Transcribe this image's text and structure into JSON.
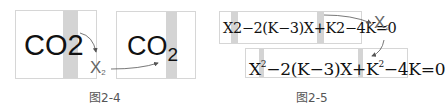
{
  "figure_2_4": {
    "before_text": "CO2",
    "after_main": "CO",
    "after_sub": "2",
    "tool_main": "X",
    "tool_sub": "2",
    "caption": "图2-4"
  },
  "figure_2_5": {
    "before_text": "X2−2(K−3)X+K2−4K=0",
    "after_parts": {
      "p1": "X",
      "sup1": "2",
      "p2": "−2(K−3)X+K",
      "sup2": "2",
      "p3": "−4K=0"
    },
    "tool_main": "X",
    "tool_sub": "2",
    "caption": "图2-5"
  },
  "colors": {
    "highlight_band": "#d4d4d4",
    "box_border": "#d6d6d6",
    "arrow": "#555555",
    "caption": "#555555"
  }
}
